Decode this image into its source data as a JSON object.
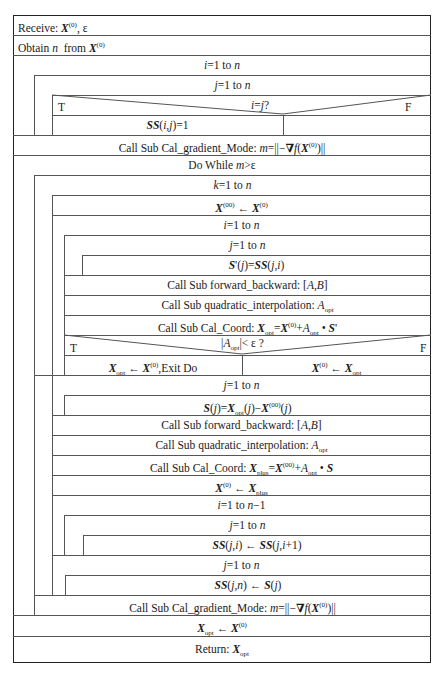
{
  "diagram": {
    "type": "N-S structured flowchart (Nassi-Shneiderman)",
    "blocks": {
      "receive": "Receive: X(0), ε",
      "obtain": "Obtain n  from X(0)",
      "loop_i1": "i=1 to n",
      "loop_j1": "j=1 to n",
      "decision1": {
        "condition": "i=j?",
        "true_label": "T",
        "false_label": "F",
        "true_branch": "SS(i,j)=1",
        "false_branch": ""
      },
      "gradient1": "Call Sub Cal_gradient_Mode: m=||−∇f(X(0))||",
      "do_while": "Do While  m>ε",
      "loop_k": "k=1 to n",
      "assign_x00": "X(00) ← X(0)",
      "loop_i2": "i=1 to n",
      "loop_j2": "j=1 to n",
      "assign_s_prime": "S'(j)=SS(j,i)",
      "forward_backward1": "Call Sub forward_backward: [A,B]",
      "quadratic1": "Call Sub quadratic_interpolation: Aopt",
      "cal_coord1": "Call Sub Cal_Coord: Xopt=X(0)+Aopt • S'",
      "decision2": {
        "condition": "|Aopt|< ε ?",
        "true_label": "T",
        "false_label": "F",
        "true_branch": "Xopt ← X(0),Exit Do",
        "false_branch": "X(0) ← Xopt"
      },
      "loop_j3": "j=1 to n",
      "assign_s": "S(j)=Xopt(j)−X(00)(j)",
      "forward_backward2": "Call Sub forward_backward: [A,B]",
      "quadratic2": "Call Sub quadratic_interpolation: Aopt",
      "cal_coord2": "Call Sub Cal_Coord: Xplus=X(00)+Aopt • S",
      "assign_xplus": "X(0) ← Xplus",
      "loop_i3": "i=1 to n−1",
      "loop_j4": "j=1 to n",
      "shift_ss": "SS(j,i) ← SS(j,i+1)",
      "loop_j5": "j=1 to n",
      "assign_ssn": "SS(j,n) ← S(j)",
      "gradient2": "Call Sub Cal_gradient_Mode: m=||−∇f(X(0))||",
      "assign_xopt": "Xopt ← X(0)",
      "return": "Return: Xopt"
    }
  },
  "labels": {
    "receive_prefix": "Receive: ",
    "obtain_prefix": "Obtain ",
    "call_grad": "Call Sub Cal_gradient_Mode: ",
    "call_fb": "Call Sub forward_backward: ",
    "call_quad": "Call Sub quadratic_interpolation: ",
    "call_coord": "Call Sub Cal_Coord: ",
    "do_while": "Do While ",
    "return_prefix": "Return: ",
    "exit_do": ",Exit Do",
    "T": "T",
    "F": "F"
  }
}
